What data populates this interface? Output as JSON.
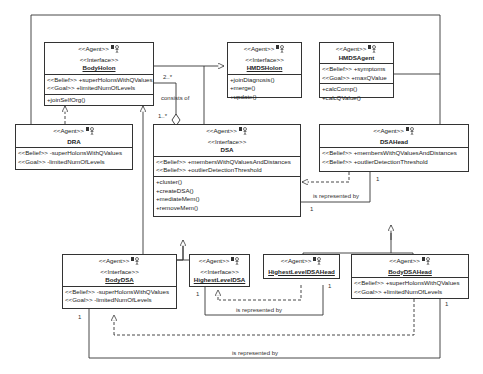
{
  "diagram": {
    "type": "UML class diagram",
    "classes": {
      "bodyHolon": {
        "stereotype": "<<Agent>>",
        "interface": "<<Interface>>",
        "name": "BodyHolon",
        "attributes": [
          "<<Belief>> +superHolonsWithQValues",
          "<<Goal>> +limitedNumOfLevels"
        ],
        "operations": [
          "+joinSelfOrg()"
        ]
      },
      "hmdsHolon": {
        "stereotype": "<<Agent>>",
        "interface": "<<Interface>>",
        "name": "HMDSHolon",
        "operations": [
          "+joinDiagnosis()",
          "+merge()",
          "+update()"
        ]
      },
      "hmdsAgent": {
        "stereotype": "<<Agent>>",
        "name": "HMDSAgent",
        "attributes": [
          "<<Belief>> +symptoms",
          "<<Goal>> +maxQValue"
        ],
        "operations": [
          "+calcComp()",
          "+calcQValue()"
        ]
      },
      "dra": {
        "stereotype": "<<Agent>>",
        "name": "DRA",
        "attributes": [
          "<<Belief>> -superHolonsWithQValues",
          "<<Goal>> -limitedNumOfLevels"
        ]
      },
      "dsa": {
        "stereotype": "<<Agent>>",
        "interface": "<<Interface>>",
        "name": "DSA",
        "attributes": [
          "<<Belief>> +membersWithQValuesAndDistances",
          "<<Belief>> +outlierDetectionThreshold"
        ],
        "operations": [
          "+cluster()",
          "+createDSA()",
          "+mediateMem()",
          "+removeMem()"
        ]
      },
      "dsaHead": {
        "stereotype": "<<Agent>>",
        "name": "DSAHead",
        "attributes": [
          "<<Belief>> +membersWithQValuesAndDistances",
          "<<Belief>> +outlierDetectionThreshold"
        ]
      },
      "bodyDSA": {
        "stereotype": "<<Agent>>",
        "interface": "<<Interface>>",
        "name": "BodyDSA",
        "attributes": [
          "<<Belief>> -superHolonsWithQValues",
          "<<Goal>> -limitedNumOfLevels"
        ]
      },
      "highestLevelDSA": {
        "stereotype": "<<Agent>>",
        "interface": "<<Interface>>",
        "name": "HighestLevelDSA"
      },
      "highestLevelDSAHead": {
        "stereotype": "<<Agent>>",
        "name": "HighestLevelDSAHead"
      },
      "bodyDSAHead": {
        "stereotype": "<<Agent>>",
        "name": "BodyDSAHead",
        "attributes": [
          "<<Belief>> +superHolonsWithQValues",
          "<<Goal>> +limitedNumOfLevels"
        ]
      }
    },
    "labels": {
      "consistsOf": "consists of",
      "mult_2n": "2..*",
      "mult_1n": "1..*",
      "represented1": "is represented by",
      "represented2": "is represented by",
      "represented3": "is represented by",
      "one_a": "1",
      "one_b": "1",
      "one_c": "1",
      "one_d": "1",
      "one_e": "1",
      "one_f": "1"
    }
  }
}
